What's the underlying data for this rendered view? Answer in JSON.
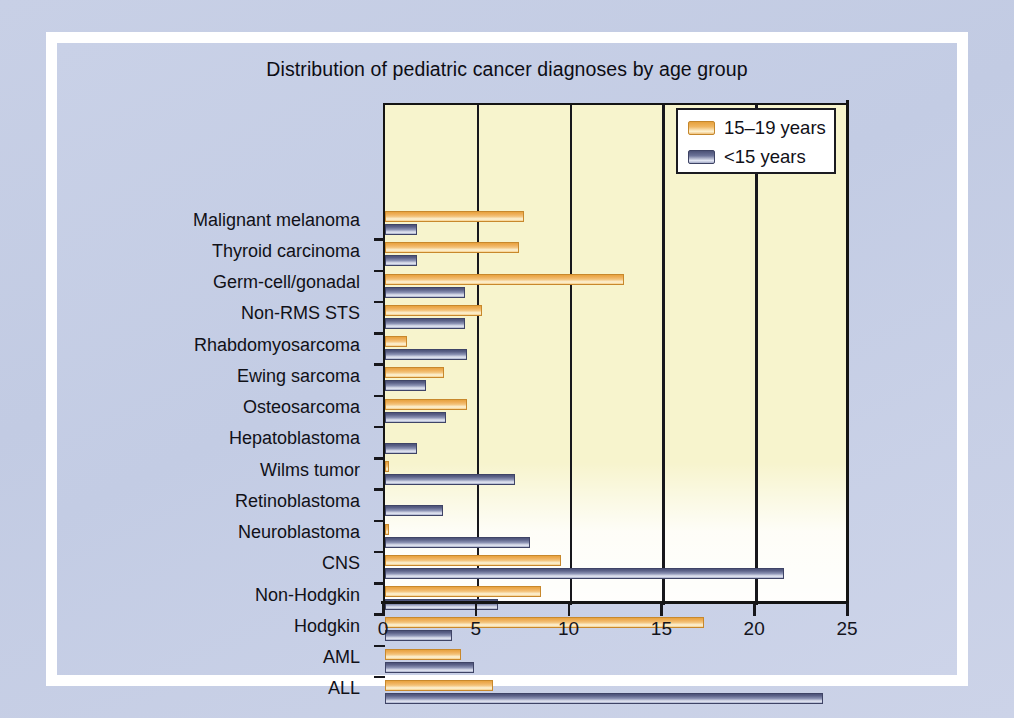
{
  "figure": {
    "background_color": "#c6cfe5",
    "plot_background_color": "#f7f4cd",
    "series_colors": {
      "15-19 years": "#eead56",
      "<15 years": "#6d7499"
    }
  },
  "legend": {
    "position": "top-right",
    "entries": [
      {
        "label": "15–19 years",
        "swatch": "orange-swatch-icon"
      },
      {
        "label": "<15 years",
        "swatch": "blue-swatch-icon"
      }
    ]
  },
  "axis": {
    "x_ticks": [
      "0",
      "5",
      "10",
      "15",
      "20",
      "25"
    ],
    "x_tick_values": [
      0,
      5,
      10,
      15,
      20,
      25
    ],
    "x_min": 0,
    "x_max": 25
  },
  "chart_data": {
    "type": "bar",
    "orientation": "horizontal",
    "title": "Distribution of pediatric cancer diagnoses by age group",
    "xlabel": "",
    "ylabel": "",
    "xlim": [
      0,
      25
    ],
    "grid": true,
    "legend_position": "top-right",
    "categories": [
      "Malignant melanoma",
      "Thyroid carcinoma",
      "Germ-cell/gonadal",
      "Non-RMS STS",
      "Rhabdomyosarcoma",
      "Ewing sarcoma",
      "Osteosarcoma",
      "Hepatoblastoma",
      "Wilms tumor",
      "Retinoblastoma",
      "Neuroblastoma",
      "CNS",
      "Non-Hodgkin",
      "Hodgkin",
      "AML",
      "ALL"
    ],
    "series": [
      {
        "name": "15–19 years",
        "color": "#eead56",
        "values": [
          7.5,
          7.2,
          12.9,
          5.2,
          1.2,
          3.2,
          4.4,
          0,
          0.2,
          0,
          0.2,
          9.5,
          8.4,
          17.2,
          4.1,
          5.8
        ]
      },
      {
        "name": "<15 years",
        "color": "#6d7499",
        "values": [
          1.7,
          1.7,
          4.3,
          4.3,
          4.4,
          2.2,
          3.3,
          1.7,
          7.0,
          3.1,
          7.8,
          21.5,
          6.1,
          3.6,
          4.8,
          23.6
        ]
      }
    ]
  }
}
